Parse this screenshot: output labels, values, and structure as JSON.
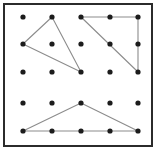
{
  "figure": {
    "frame": {
      "border_color": "#2b2b2b",
      "background_color": "#ffffff",
      "x": 3,
      "y": 3,
      "width": 150,
      "height": 144
    },
    "grid": {
      "rows": 5,
      "cols": 5,
      "col_x": [
        23,
        52,
        81,
        110,
        138
      ],
      "row_y": [
        17,
        44,
        72,
        103,
        131
      ],
      "dot_color": "#1c1c1c",
      "dot_radius": 2.6
    },
    "line_color": "#8c8c8c",
    "line_width": 1.1,
    "shapes": [
      {
        "name": "left-triangle",
        "label": "Left scalene triangle",
        "vertices": [
          [
            52,
            17
          ],
          [
            23,
            44
          ],
          [
            81,
            72
          ]
        ]
      },
      {
        "name": "right-triangle",
        "label": "Right triangle upper-right",
        "vertices": [
          [
            81,
            17
          ],
          [
            138,
            17
          ],
          [
            138,
            72
          ]
        ]
      },
      {
        "name": "bottom-triangle",
        "label": "Bottom obtuse triangle",
        "vertices": [
          [
            23,
            131
          ],
          [
            81,
            103
          ],
          [
            138,
            131
          ]
        ]
      }
    ]
  }
}
